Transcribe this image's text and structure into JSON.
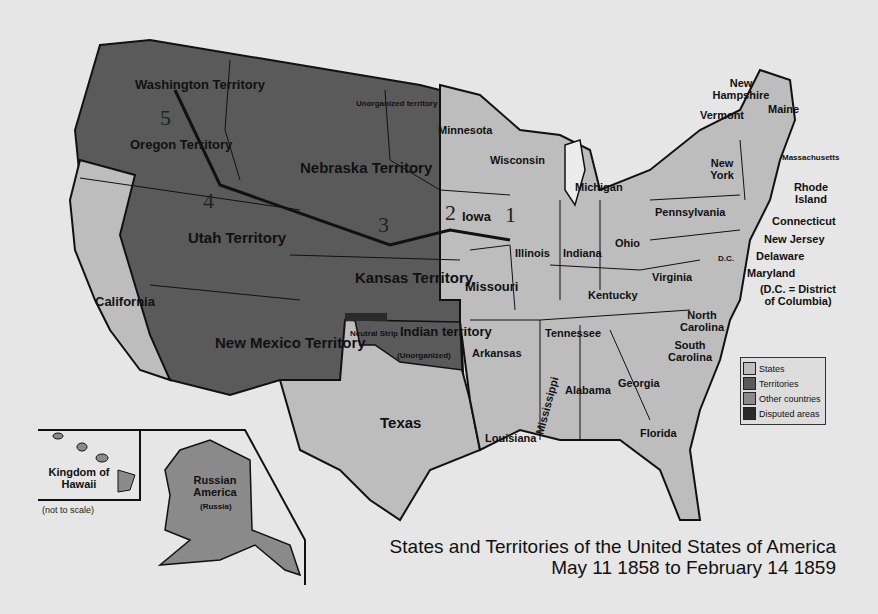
{
  "title": {
    "line1": "States and Territories of the United States of America",
    "line2": "May 11 1858 to February 14 1859"
  },
  "colors": {
    "states": "#bdbdbd",
    "territories": "#5a5a5a",
    "other_countries": "#8a8a8a",
    "disputed": "#2a2a2a",
    "background": "#e6e6e6"
  },
  "legend": [
    {
      "label": "States",
      "color": "#bdbdbd"
    },
    {
      "label": "Territories",
      "color": "#5a5a5a"
    },
    {
      "label": "Other countries",
      "color": "#8a8a8a"
    },
    {
      "label": "Disputed areas",
      "color": "#2a2a2a"
    }
  ],
  "territories": {
    "washington": "Washington Territory",
    "oregon": "Oregon Territory",
    "nebraska": "Nebraska Territory",
    "unorganized": "Unorganized territory",
    "utah": "Utah Territory",
    "kansas": "Kansas Territory",
    "new_mexico": "New Mexico Territory",
    "indian": "Indian territory",
    "indian_sub": "(Unorganized)",
    "neutral": "Neutral Strip"
  },
  "states": {
    "california": "California",
    "texas": "Texas",
    "minnesota": "Minnesota",
    "iowa": "Iowa",
    "missouri": "Missouri",
    "arkansas": "Arkansas",
    "louisiana": "Louisiana",
    "wisconsin": "Wisconsin",
    "illinois": "Illinois",
    "michigan": "Michigan",
    "indiana": "Indiana",
    "ohio": "Ohio",
    "kentucky": "Kentucky",
    "tennessee": "Tennessee",
    "mississippi": "Mississippi",
    "alabama": "Alabama",
    "georgia": "Georgia",
    "florida": "Florida",
    "south_carolina": "South Carolina",
    "north_carolina": "North Carolina",
    "virginia": "Virginia",
    "pennsylvania": "Pennsylvania",
    "new_york": "New York",
    "vermont": "Vermont",
    "new_hampshire": "New Hampshire",
    "maine": "Maine",
    "massachusetts": "Massachusetts",
    "rhode_island": "Rhode Island",
    "connecticut": "Connecticut",
    "new_jersey": "New Jersey",
    "delaware": "Delaware",
    "maryland": "Maryland",
    "dc": "D.C."
  },
  "notes": {
    "dc_note": "(D.C. = District of Columbia)",
    "not_to_scale": "(not to scale)"
  },
  "other": {
    "hawaii": "Kingdom of Hawaii",
    "russian_america": "Russian America",
    "russia": "(Russia)"
  },
  "route_numbers": [
    "1",
    "2",
    "3",
    "4",
    "5"
  ]
}
